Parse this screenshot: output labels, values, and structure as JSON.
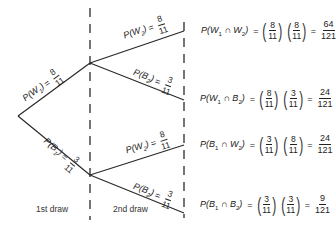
{
  "diagram": {
    "type": "probability-tree",
    "stages": [
      {
        "label": "1st draw"
      },
      {
        "label": "2nd draw"
      }
    ],
    "first_draw_branches": [
      {
        "event": "W",
        "sub": "1",
        "num": "8",
        "den": "11"
      },
      {
        "event": "B",
        "sub": "1",
        "num": "3",
        "den": "11"
      }
    ],
    "second_draw_branches": [
      {
        "parent": "W1",
        "event": "W",
        "sub": "2",
        "num": "8",
        "den": "11"
      },
      {
        "parent": "W1",
        "event": "B",
        "sub": "2",
        "num": "3",
        "den": "11"
      },
      {
        "parent": "B1",
        "event": "W",
        "sub": "2",
        "num": "8",
        "den": "11"
      },
      {
        "parent": "B1",
        "event": "B",
        "sub": "2",
        "num": "3",
        "den": "11"
      }
    ],
    "outcomes": [
      {
        "a": "W",
        "a_sub": "1",
        "b": "W",
        "b_sub": "2",
        "f1_num": "8",
        "f1_den": "11",
        "f2_num": "8",
        "f2_den": "11",
        "res_num": "64",
        "res_den": "121"
      },
      {
        "a": "W",
        "a_sub": "1",
        "b": "B",
        "b_sub": "2",
        "f1_num": "8",
        "f1_den": "11",
        "f2_num": "3",
        "f2_den": "11",
        "res_num": "24",
        "res_den": "121"
      },
      {
        "a": "B",
        "a_sub": "1",
        "b": "W",
        "b_sub": "2",
        "f1_num": "3",
        "f1_den": "11",
        "f2_num": "8",
        "f2_den": "11",
        "res_num": "24",
        "res_den": "121"
      },
      {
        "a": "B",
        "a_sub": "1",
        "b": "B",
        "b_sub": "2",
        "f1_num": "3",
        "f1_den": "11",
        "f2_num": "3",
        "f2_den": "11",
        "res_num": "9",
        "res_den": "121"
      }
    ],
    "symbols": {
      "prob": "P",
      "intersect": "∩",
      "equals": "="
    },
    "colors": {
      "line": "#2a2a2a",
      "text": "#222222",
      "background": "#ffffff"
    }
  }
}
